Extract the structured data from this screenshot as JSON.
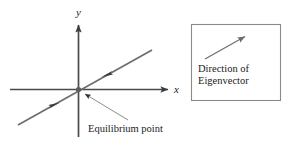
{
  "figure": {
    "type": "phase-portrait-diagram",
    "background_color": "#ffffff",
    "line_color": "#5a5a5a",
    "axis_color": "#4a4a4a",
    "text_color": "#1a1a1a",
    "box_border_color": "#808080"
  },
  "axes": {
    "x_label": "x",
    "y_label": "y",
    "origin": {
      "x": 78,
      "y": 89
    },
    "x_axis": {
      "x1": 10,
      "y1": 89,
      "x2": 170,
      "y2": 89
    },
    "y_axis": {
      "x1": 78,
      "y1": 137,
      "x2": 78,
      "y2": 22
    }
  },
  "eigen_line": {
    "start": {
      "x": 18,
      "y": 125
    },
    "end": {
      "x": 152,
      "y": 50
    },
    "arrow_upper": {
      "x": 106,
      "y": 75
    },
    "arrow_lower": {
      "x": 55,
      "y": 104
    },
    "arrow_direction": "toward-equilibrium"
  },
  "annotations": {
    "equilibrium_label": "Equilibrium point",
    "leader_line": {
      "x1": 128,
      "y1": 120,
      "x2": 84,
      "y2": 93
    }
  },
  "legend_box": {
    "rect": {
      "x": 191,
      "y": 24,
      "width": 90,
      "height": 77
    },
    "arrow": {
      "x1": 205,
      "y1": 59,
      "x2": 248,
      "y2": 35
    },
    "caption_line1": "Direction of",
    "caption_line2": "Eigenvector"
  }
}
